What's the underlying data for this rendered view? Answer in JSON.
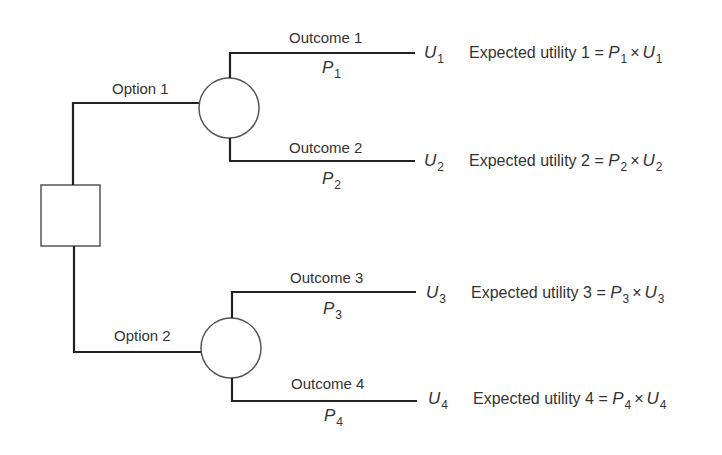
{
  "diagram": {
    "type": "decision-tree",
    "colors": {
      "line": "#222222",
      "node_stroke": "#555555",
      "text": "#333333",
      "background": "#ffffff"
    },
    "decision_node": {
      "shape": "square"
    },
    "options": [
      {
        "label": "Option 1",
        "chance_node": {
          "shape": "circle"
        },
        "outcomes": [
          {
            "label": "Outcome 1",
            "prob_var": "P",
            "prob_sub": "1",
            "util_var": "U",
            "util_sub": "1",
            "eq_text": "Expected utility 1 = ",
            "eq_p": "P",
            "eq_p_sub": "1",
            "eq_times": "×",
            "eq_u": "U",
            "eq_u_sub": "1"
          },
          {
            "label": "Outcome 2",
            "prob_var": "P",
            "prob_sub": "2",
            "util_var": "U",
            "util_sub": "2",
            "eq_text": "Expected utility 2 = ",
            "eq_p": "P",
            "eq_p_sub": "2",
            "eq_times": "×",
            "eq_u": "U",
            "eq_u_sub": "2"
          }
        ]
      },
      {
        "label": "Option 2",
        "chance_node": {
          "shape": "circle"
        },
        "outcomes": [
          {
            "label": "Outcome 3",
            "prob_var": "P",
            "prob_sub": "3",
            "util_var": "U",
            "util_sub": "3",
            "eq_text": "Expected utility 3 = ",
            "eq_p": "P",
            "eq_p_sub": "3",
            "eq_times": "×",
            "eq_u": "U",
            "eq_u_sub": "3"
          },
          {
            "label": "Outcome 4",
            "prob_var": "P",
            "prob_sub": "4",
            "util_var": "U",
            "util_sub": "4",
            "eq_text": "Expected utility 4 = ",
            "eq_p": "P",
            "eq_p_sub": "4",
            "eq_times": "×",
            "eq_u": "U",
            "eq_u_sub": "4"
          }
        ]
      }
    ]
  }
}
